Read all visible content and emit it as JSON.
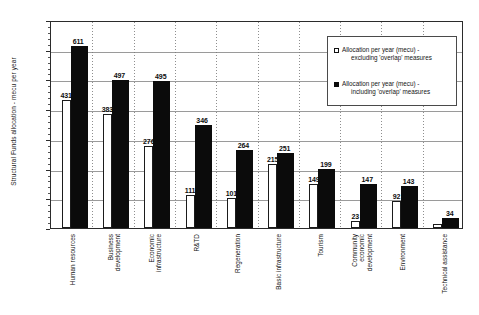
{
  "chart_data": {
    "type": "bar",
    "title": "",
    "xlabel": "",
    "ylabel": "Structural Funds allocation - mecu per year",
    "ylim": [
      0,
      700
    ],
    "ytick_step": 100,
    "yticks": [
      0,
      100,
      200,
      300,
      400,
      500,
      600,
      700
    ],
    "grid": true,
    "legend_position": "upper right",
    "categories": [
      "Human resources",
      "Business development",
      "Economic infrastructure",
      "R&TD",
      "Regeneration",
      "Basic infrastructure",
      "Tourism",
      "Community economic development",
      "Environment",
      "Technical assistance"
    ],
    "series": [
      {
        "name": "Allocation per year (mecu) - excluding 'overlap' measures",
        "color": "#ffffff",
        "values": [
          431,
          383,
          276,
          111,
          101,
          215,
          149,
          23,
          92,
          14
        ],
        "labels": [
          "431",
          "383",
          "276",
          "111",
          "101",
          "215",
          "149",
          "23",
          "92",
          ""
        ]
      },
      {
        "name": "Allocation per year (mecu) - including 'overlap' measures",
        "color": "#0b0b0b",
        "values": [
          611,
          497,
          495,
          346,
          264,
          251,
          199,
          147,
          143,
          34
        ],
        "labels": [
          "611",
          "497",
          "495",
          "346",
          "264",
          "251",
          "199",
          "147",
          "143",
          "34"
        ]
      }
    ]
  },
  "legend": {
    "items": [
      {
        "line1": "Allocation per year (mecu) -",
        "line2": "excluding 'overlap' measures",
        "swatch": "white-square-icon"
      },
      {
        "line1": "Allocation per year (mecu) -",
        "line2": "including 'overlap' measures",
        "swatch": "black-square-icon"
      }
    ]
  },
  "category_label_lines": [
    [
      "Human resources"
    ],
    [
      "Business",
      "development"
    ],
    [
      "Economic",
      "infrastructure"
    ],
    [
      "R&TD"
    ],
    [
      "Regeneration"
    ],
    [
      "Basic infrastructure"
    ],
    [
      "Tourism"
    ],
    [
      "Community",
      "economic",
      "development"
    ],
    [
      "Environment"
    ],
    [
      "Technical assistance"
    ]
  ]
}
